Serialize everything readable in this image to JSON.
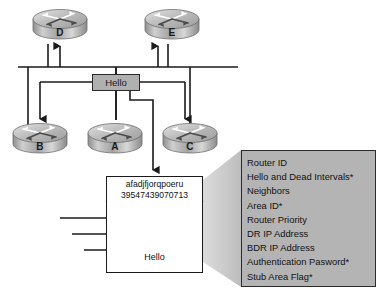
{
  "diagram": {
    "colors": {
      "background": "#ffffff",
      "line": "#1a1a1a",
      "box_fill": "#b0b0b0",
      "panel_fill": "#b4b4b4",
      "cone_fill": "#c9c9c9",
      "router_body": "#9a9a9a",
      "router_top": "#d4d4d4"
    },
    "routers": [
      {
        "id": "router-d",
        "label": "D",
        "x": 30,
        "y": 6
      },
      {
        "id": "router-e",
        "label": "E",
        "x": 142,
        "y": 6
      },
      {
        "id": "router-b",
        "label": "B",
        "x": 10,
        "y": 120
      },
      {
        "id": "router-a",
        "label": "A",
        "x": 85,
        "y": 120
      },
      {
        "id": "router-c",
        "label": "C",
        "x": 160,
        "y": 120
      }
    ],
    "hello_box": {
      "label": "Hello"
    },
    "envelope": {
      "address_line1": "afadjfjorqpoeru",
      "address_line2": "39547439070713",
      "footer_label": "Hello"
    },
    "callout": {
      "items": [
        "Router ID",
        "Hello and Dead Intervals*",
        "Neighbors",
        "Area ID*",
        "Router Priority",
        "DR IP Address",
        "BDR IP Address",
        "Authentication Pasword*",
        "Stub Area Flag*"
      ]
    }
  }
}
